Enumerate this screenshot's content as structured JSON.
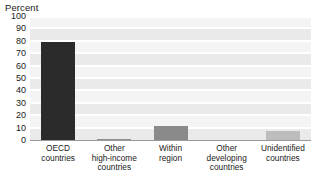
{
  "chart_data": {
    "type": "bar",
    "title": "",
    "subtitle": "",
    "xlabel": "",
    "ylabel": "Percent",
    "ylim": [
      0,
      100
    ],
    "yticks": [
      100,
      90,
      80,
      70,
      60,
      50,
      40,
      30,
      20,
      10,
      0
    ],
    "grid": true,
    "legend": "none",
    "categories": [
      "OECD\ncountries",
      "Other\nhigh-income\ncountries",
      "Within\nregion",
      "Other\ndeveloping\ncountries",
      "Unidentified\ncountries"
    ],
    "values": [
      79,
      1,
      11,
      0,
      7
    ],
    "bar_colors": [
      "#2b2b2b",
      "#8f8f8f",
      "#8a8a8a",
      "#b5b5b5",
      "#bdbdbd"
    ]
  },
  "colors": {
    "plot_background": "#f1f1f1",
    "gridline": "#ffffff",
    "axis_line": "#9a9a9a",
    "text": "#1a1a1a"
  }
}
